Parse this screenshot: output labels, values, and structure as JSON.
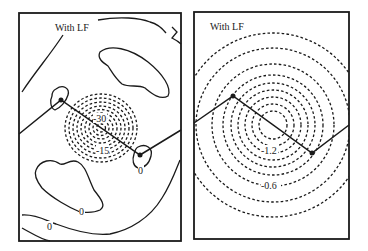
{
  "figure": {
    "panels": [
      {
        "title": "With LF",
        "contour_labels": {
          "inner": "-30",
          "outer": "-15",
          "zero_a": "0",
          "zero_b": "0",
          "zero_c": "0"
        }
      },
      {
        "title": "With LF",
        "contour_labels": {
          "inner": "-1.2",
          "outer": "-0.6"
        }
      }
    ]
  }
}
